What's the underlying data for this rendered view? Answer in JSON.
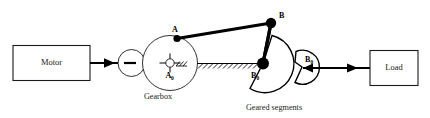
{
  "figure": {
    "type": "mechanism-diagram",
    "background_color": "#ffffff",
    "line_color": "#000000"
  },
  "blocks": [
    {
      "id": "motor",
      "label": "Motor"
    },
    {
      "id": "load",
      "label": "Load"
    }
  ],
  "captions": [
    {
      "id": "gearbox",
      "label": "Gearbox"
    },
    {
      "id": "geared-segments",
      "label": "Geared segments"
    }
  ],
  "joints": [
    {
      "id": "A",
      "label": "A",
      "subscript": ""
    },
    {
      "id": "A0",
      "label": "A",
      "subscript": "0"
    },
    {
      "id": "B",
      "label": "B",
      "subscript": ""
    },
    {
      "id": "B0",
      "label": "B",
      "subscript": "0"
    },
    {
      "id": "B0p",
      "label": "B",
      "subscript": "0"
    }
  ],
  "labels": {
    "motor": "Motor",
    "load": "Load",
    "gearbox": "Gearbox",
    "geared_segments": "Geared segments",
    "point_a": "A",
    "point_a0_base": "A",
    "point_a0_sub": "0",
    "point_b": "B",
    "point_b0_base": "B",
    "point_b0_sub": "0",
    "point_b0p_base": "B",
    "point_b0p_sub": "0",
    "prime_mark": "'"
  },
  "icons": {
    "input_arrow": "arrow-right-icon",
    "output_arrow": "arrow-right-icon",
    "reaction_arrow": "arrow-left-icon",
    "ground_hatch": "ground-hatching-icon",
    "fixed_pivot": "fixed-pivot-icon"
  }
}
